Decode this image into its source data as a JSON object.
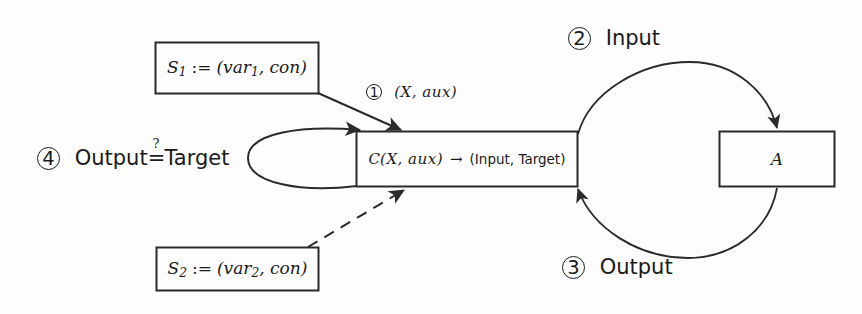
{
  "diagram": {
    "stroke_color": "#2a2a2a",
    "text_color": "#1a1a1a",
    "background": "#fdfdfd",
    "nodes": {
      "spec1": {
        "name": "S1",
        "symbol": "S",
        "subscript": "1",
        "assign": ":=",
        "value": "(var",
        "value_sub": "1",
        "value_tail": ", con)"
      },
      "spec2": {
        "name": "S2",
        "symbol": "S",
        "subscript": "2",
        "assign": ":=",
        "value": "(var",
        "value_sub": "2",
        "value_tail": ", con)"
      },
      "compiler": {
        "symbol": "C",
        "args": "(X, aux)",
        "arrow": "→",
        "result": "(Input, Target)"
      },
      "agent": {
        "symbol": "A"
      }
    },
    "edges": {
      "step1": {
        "marker": "1",
        "label": "(X, aux)"
      },
      "step2": {
        "marker": "2",
        "label": "Input"
      },
      "step3": {
        "marker": "3",
        "label": "Output"
      },
      "step4": {
        "marker": "4",
        "label_left": "Output",
        "relation": "=",
        "relation_super": "?",
        "label_right": "Target"
      },
      "dashed_from_spec2": {
        "style": "dashed",
        "label": ""
      }
    }
  }
}
